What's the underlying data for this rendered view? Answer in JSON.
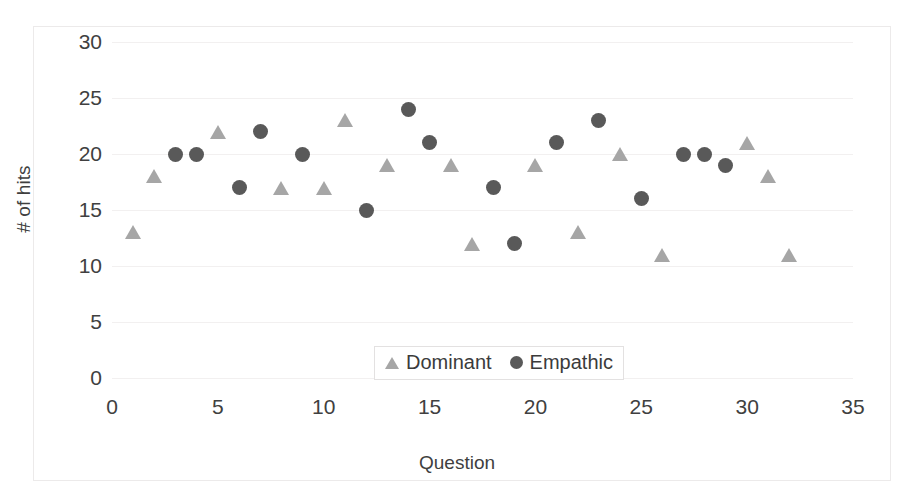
{
  "chart_data": {
    "type": "scatter",
    "title": "",
    "xlabel": "Question",
    "ylabel": "# of hits",
    "xlim": [
      0,
      35
    ],
    "ylim": [
      0,
      30
    ],
    "grid": true,
    "gridlines_axis": "y",
    "legend_position": "inside-bottom-center",
    "x_ticks": [
      0,
      5,
      10,
      15,
      20,
      25,
      30,
      35
    ],
    "y_ticks": [
      0,
      5,
      10,
      15,
      20,
      25,
      30
    ],
    "series": [
      {
        "name": "Dominant",
        "marker": "triangle",
        "color": "#a6a6a6",
        "points": [
          [
            1,
            13
          ],
          [
            2,
            18
          ],
          [
            5,
            22
          ],
          [
            8,
            17
          ],
          [
            10,
            17
          ],
          [
            11,
            23
          ],
          [
            13,
            19
          ],
          [
            16,
            19
          ],
          [
            17,
            12
          ],
          [
            20,
            19
          ],
          [
            22,
            13
          ],
          [
            24,
            20
          ],
          [
            26,
            11
          ],
          [
            30,
            21
          ],
          [
            31,
            18
          ],
          [
            32,
            11
          ]
        ]
      },
      {
        "name": "Empathic",
        "marker": "circle",
        "color": "#595959",
        "points": [
          [
            3,
            20
          ],
          [
            4,
            20
          ],
          [
            6,
            17
          ],
          [
            7,
            22
          ],
          [
            9,
            20
          ],
          [
            12,
            15
          ],
          [
            14,
            24
          ],
          [
            15,
            21
          ],
          [
            18,
            17
          ],
          [
            19,
            12
          ],
          [
            21,
            21
          ],
          [
            23,
            23
          ],
          [
            25,
            16
          ],
          [
            27,
            20
          ],
          [
            28,
            20
          ],
          [
            29,
            19
          ]
        ]
      }
    ]
  },
  "colors": {
    "dominant": "#a6a6a6",
    "empathic": "#595959",
    "gridline": "#f2f0f0",
    "axis_text": "#404040",
    "frame": "#eceaea",
    "background": "#ffffff"
  }
}
